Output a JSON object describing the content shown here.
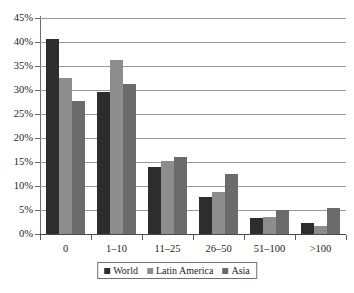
{
  "chart_data": {
    "type": "bar",
    "title": "",
    "subtitle": "",
    "xlabel": "",
    "ylabel": "",
    "categories": [
      "0",
      "1–10",
      "11–25",
      "26–50",
      "51–100",
      ">100"
    ],
    "series": [
      {
        "name": "World",
        "color": "#2d2d2d",
        "values": [
          40.6,
          29.6,
          14.0,
          7.8,
          3.4,
          2.2
        ]
      },
      {
        "name": "Latin America",
        "color": "#8d8d8d",
        "values": [
          32.5,
          36.3,
          15.2,
          8.8,
          3.6,
          1.6
        ]
      },
      {
        "name": "Asia",
        "color": "#6b6b6b",
        "values": [
          27.7,
          31.3,
          16.1,
          12.4,
          4.9,
          5.5
        ]
      }
    ],
    "ylim": [
      0,
      45
    ],
    "ytick_step": 5,
    "ytick_labels": [
      "45%",
      "40%",
      "35%",
      "30%",
      "25%",
      "20%",
      "15%",
      "10%",
      "5%",
      "0%"
    ],
    "ytick_values": [
      45,
      40,
      35,
      30,
      25,
      20,
      15,
      10,
      5,
      0
    ],
    "grid": "horizontal",
    "legend_position": "bottom",
    "legend_entries": [
      "World",
      "Latin America",
      "Asia"
    ]
  }
}
